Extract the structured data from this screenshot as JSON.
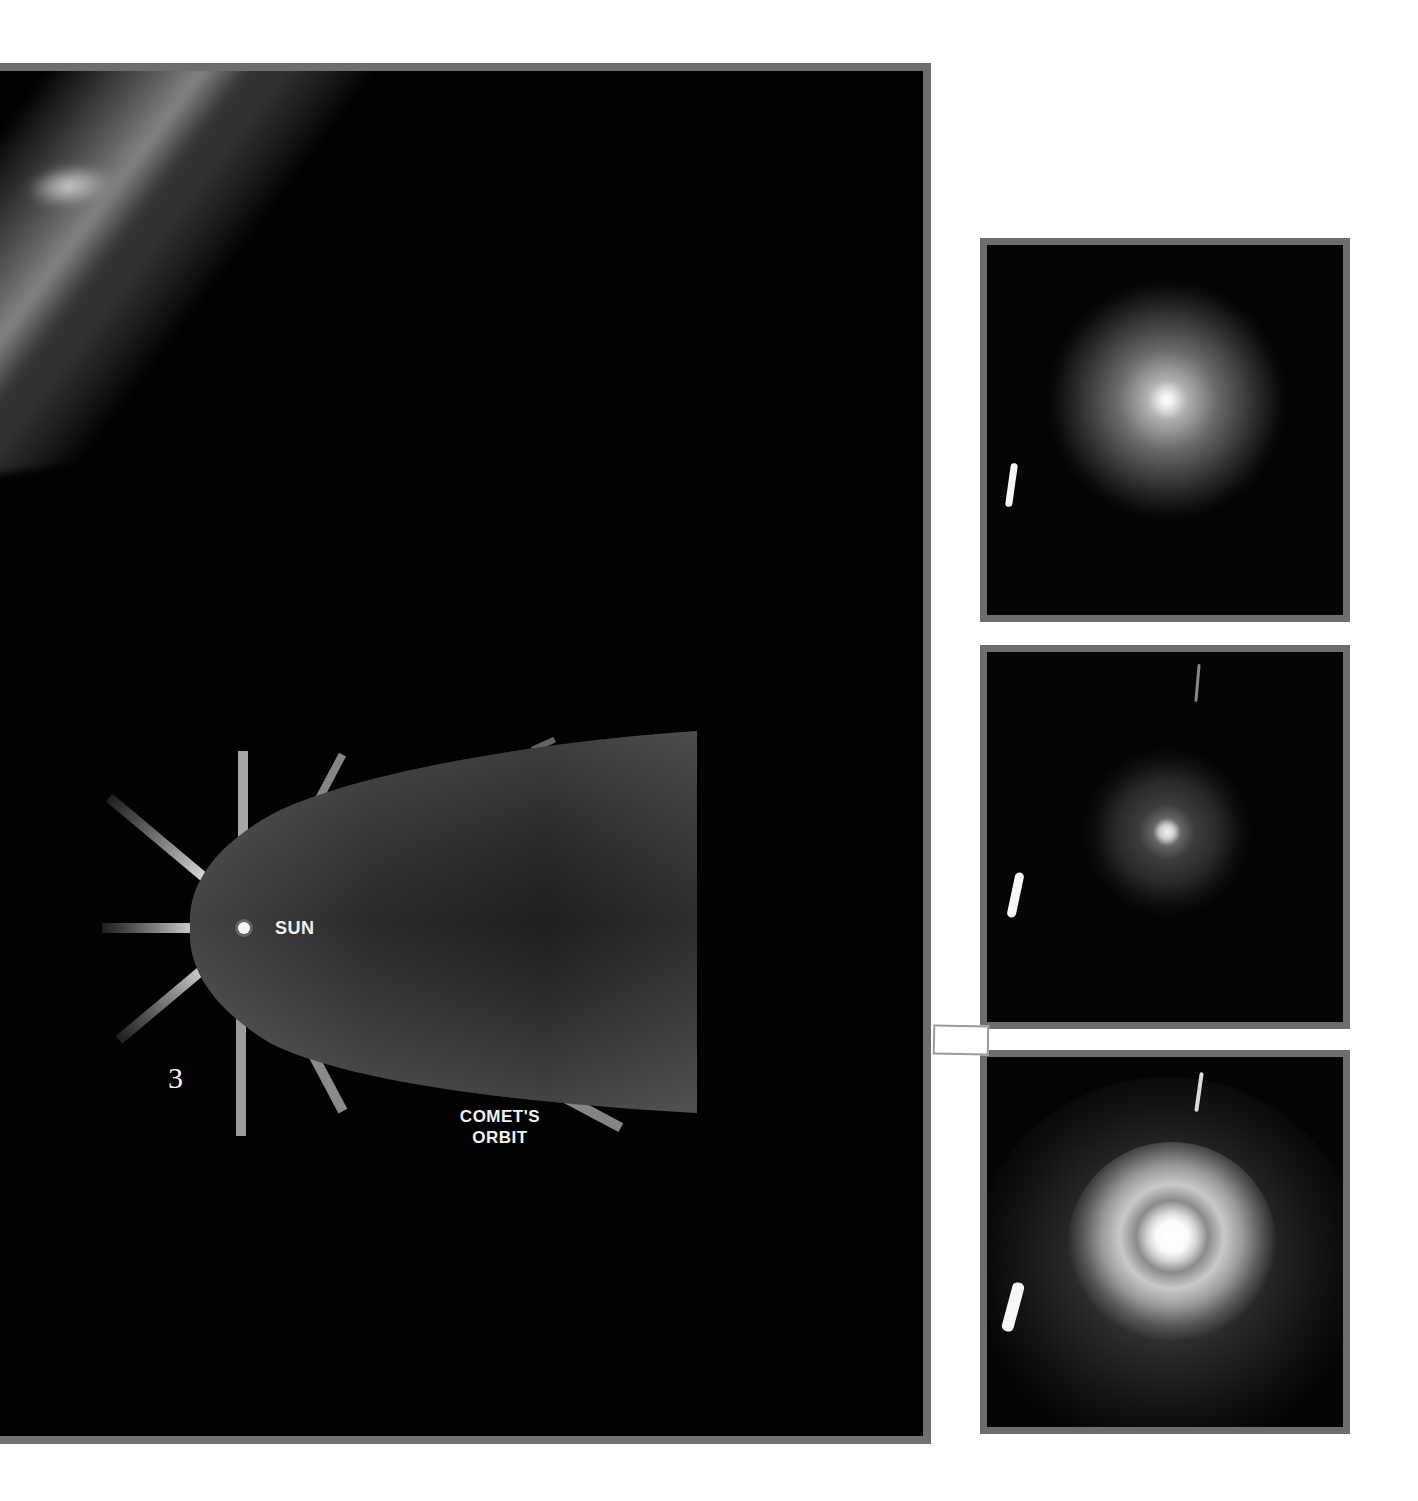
{
  "figure": {
    "number": "3",
    "diagram": {
      "sun_label": "SUN",
      "orbit_label_line1": "COMET'S",
      "orbit_label_line2": "ORBIT",
      "ray_count": 8
    },
    "photo_panels": [
      {
        "index": 1,
        "description": "comet nucleus with diffuse round coma"
      },
      {
        "index": 2,
        "description": "comet nucleus with faint spiral jets"
      },
      {
        "index": 3,
        "description": "comet nucleus with bright spiral coma"
      }
    ]
  },
  "colors": {
    "panel_background": "#020202",
    "panel_border": "#6e6e6e",
    "orbit_fill": "#4a4a4a",
    "label_text": "#f2f2f2",
    "page_background": "#ffffff"
  }
}
